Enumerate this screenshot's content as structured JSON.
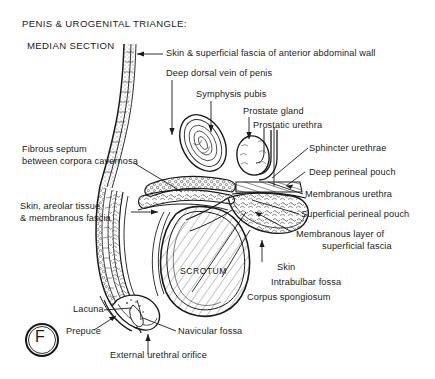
{
  "figure": {
    "title_line1": "PENIS & UROGENITAL TRIANGLE:",
    "title_line2": "MEDIAN SECTION",
    "panel_letter": "F",
    "ink_color": "#1a1a1a",
    "background_color": "#ffffff"
  },
  "labels": {
    "skin_superficial_fascia_abdominal": "Skin & superficial fascia of anterior abdominal wall",
    "deep_dorsal_vein": "Deep dorsal vein of penis",
    "symphysis_pubis": "Symphysis pubis",
    "prostate_gland": "Prostate gland",
    "prostatic_urethra": "Prostatic urethra",
    "sphincter_urethrae": "Sphincter urethrae",
    "deep_perineal_pouch": "Deep perineal pouch",
    "membranous_urethra": "Membranous urethra",
    "superficial_perineal_pouch": "Superficial perineal pouch",
    "membranous_layer_line1": "Membranous layer of",
    "membranous_layer_line2": "superficial fascia",
    "skin": "Skin",
    "intrabulbar_fossa": "Intrabulbar fossa",
    "corpus_spongiosum": "Corpus spongiosum",
    "fibrous_septum_line1": "Fibrous septum",
    "fibrous_septum_line2": "between corpora cavernosa",
    "skin_areolar_line1": "Skin, areolar tissue",
    "skin_areolar_line2": "& membranous fascia",
    "scrotum": "SCROTUM",
    "lacuna": "Lacuna",
    "prepuce": "Prepuce",
    "navicular_fossa": "Navicular fossa",
    "external_urethral_orifice": "External urethral orifice"
  }
}
